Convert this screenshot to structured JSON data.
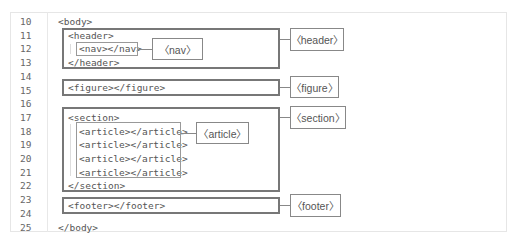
{
  "editor": {
    "line_numbers": [
      "10",
      "11",
      "12",
      "13",
      "14",
      "15",
      "16",
      "17",
      "18",
      "19",
      "20",
      "21",
      "22",
      "23",
      "24",
      "25"
    ],
    "lines": {
      "l10": "<body>",
      "l11": "<header>",
      "l12": "<nav></nav>",
      "l13": "</header>",
      "l15": "<figure></figure>",
      "l17": "<section>",
      "l18": "<article></article>",
      "l19": "<article></article>",
      "l20": "<article></article>",
      "l21": "<article></article>",
      "l22": "</section>",
      "l24": "<footer></footer>",
      "l25": "</body>"
    }
  },
  "labels": {
    "header": "〈header〉",
    "nav": "〈nav〉",
    "figure": "〈figure〉",
    "section": "〈section〉",
    "article": "〈article〉",
    "footer": "〈footer〉"
  },
  "colors": {
    "thick_border": "#777777",
    "thin_border": "#999999",
    "text": "#555555"
  }
}
